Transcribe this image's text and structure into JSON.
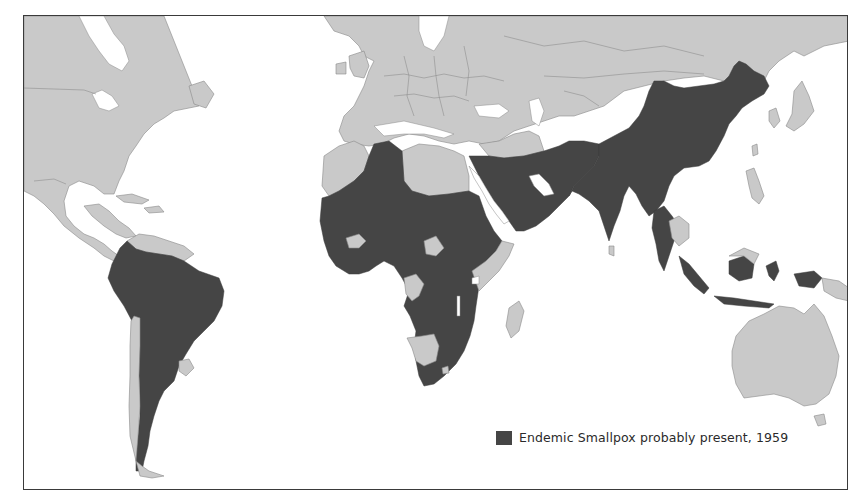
{
  "map": {
    "projection": "world",
    "colors": {
      "endemic": "#454545",
      "other_land": "#c9c9c9",
      "water": "#ffffff",
      "frame": "#3a3a3a"
    },
    "regions_endemic": [
      "South America (except Guianas, Chile coast, Uruguay)",
      "Sub-Saharan & North-West Africa",
      "Arabian Peninsula",
      "Middle East / Iran / Afghanistan / Pakistan",
      "India",
      "China",
      "Indochina (parts)",
      "Indonesia",
      "Western New Guinea"
    ],
    "regions_other": [
      "North America",
      "Central America",
      "Europe",
      "USSR",
      "Australia",
      "Japan",
      "Korea",
      "Philippines",
      "Madagascar"
    ]
  },
  "legend": {
    "label": "Endemic Smallpox probably present, 1959",
    "swatch_color": "#454545"
  }
}
